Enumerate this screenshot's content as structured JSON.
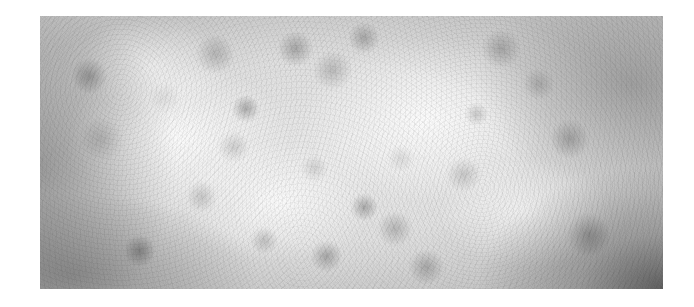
{
  "image": {
    "description": "Grayscale speckled noise texture photograph",
    "frame": {
      "x": 40,
      "y": 16,
      "width": 623,
      "height": 273
    },
    "colors": {
      "background": "#ffffff",
      "light_tone": "#f4f4f4",
      "mid_tone": "#a0a0a0",
      "dark_tone": "#3a3a3a"
    }
  }
}
